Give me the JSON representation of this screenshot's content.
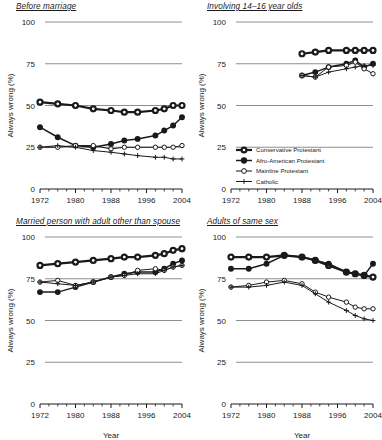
{
  "figure": {
    "axis_label_y": "Always wrong (%)",
    "axis_label_x": "Year",
    "y_ticks": [
      0,
      25,
      50,
      75,
      100
    ],
    "x_ticks": [
      1972,
      1980,
      1988,
      1996,
      2004
    ],
    "x_minor_step": 2,
    "ylim": [
      0,
      100
    ],
    "xlim": [
      1972,
      2004
    ],
    "grid": "horizontal-only",
    "colors": {
      "line": "#1a1a1a",
      "grid": "#8e8e8e",
      "background": "#ffffff"
    }
  },
  "legend": {
    "position": "bottom-left of top-right panel",
    "entries": [
      {
        "label": "Conservative Protestant",
        "marker": "open-circle",
        "line_width": "thick",
        "key": "conservative_protestant"
      },
      {
        "label": "Afro-American Protestant",
        "marker": "filled-circle",
        "line_width": "medium",
        "key": "afro_american_protestant"
      },
      {
        "label": "Mainline Protestant",
        "marker": "open-circle",
        "line_width": "thin",
        "key": "mainline_protestant"
      },
      {
        "label": "Catholic",
        "marker": "plus",
        "line_width": "thin",
        "key": "catholic"
      }
    ]
  },
  "chart_data": [
    {
      "id": "before-marriage",
      "type": "line",
      "title": "Before marriage",
      "xlabel": "",
      "ylabel": "Always wrong (%)",
      "xlim": [
        1972,
        2004
      ],
      "ylim": [
        0,
        100
      ],
      "x": [
        1972,
        1976,
        1980,
        1984,
        1988,
        1991,
        1994,
        1998,
        2000,
        2002,
        2004
      ],
      "series": [
        {
          "name": "Conservative Protestant",
          "marker": "open-circle",
          "line_width": "thick",
          "values": [
            52,
            51,
            50,
            48,
            47,
            46,
            46,
            47,
            48,
            50,
            50
          ]
        },
        {
          "name": "Afro-American Protestant",
          "marker": "filled-circle",
          "line_width": "medium",
          "values": [
            37,
            31,
            26,
            25,
            27,
            29,
            30,
            32,
            35,
            38,
            43
          ]
        },
        {
          "name": "Mainline Protestant",
          "marker": "open-circle",
          "line_width": "thin",
          "values": [
            25,
            25,
            26,
            26,
            24,
            25,
            25,
            25,
            25,
            25,
            26
          ]
        },
        {
          "name": "Catholic",
          "marker": "plus",
          "line_width": "thin",
          "values": [
            25,
            26,
            25,
            23,
            22,
            21,
            20,
            19,
            19,
            18,
            18
          ]
        }
      ]
    },
    {
      "id": "involving-14-16-year-olds",
      "type": "line",
      "title": "Involving 14–16 year olds",
      "xlabel": "",
      "ylabel": "Always wrong (%)",
      "xlim": [
        1972,
        2004
      ],
      "ylim": [
        0,
        100
      ],
      "x": [
        1988,
        1991,
        1994,
        1998,
        2000,
        2002,
        2004
      ],
      "series": [
        {
          "name": "Conservative Protestant",
          "marker": "open-circle",
          "line_width": "thick",
          "values": [
            81,
            82,
            83,
            83,
            83,
            83,
            83
          ]
        },
        {
          "name": "Afro-American Protestant",
          "marker": "filled-circle",
          "line_width": "medium",
          "values": [
            68,
            70,
            73,
            75,
            77,
            73,
            75
          ]
        },
        {
          "name": "Mainline Protestant",
          "marker": "open-circle",
          "line_width": "thin",
          "values": [
            68,
            67,
            73,
            74,
            76,
            72,
            69
          ]
        },
        {
          "name": "Catholic",
          "marker": "plus",
          "line_width": "thin",
          "values": [
            68,
            67,
            70,
            72,
            73,
            74,
            74
          ]
        }
      ]
    },
    {
      "id": "married-person-with-adult-other-than-spouse",
      "type": "line",
      "title": "Married person with adult other than spouse",
      "xlabel": "Year",
      "ylabel": "Always wrong (%)",
      "xlim": [
        1972,
        2004
      ],
      "ylim": [
        0,
        100
      ],
      "x": [
        1972,
        1976,
        1980,
        1984,
        1988,
        1991,
        1994,
        1998,
        2000,
        2002,
        2004
      ],
      "series": [
        {
          "name": "Conservative Protestant",
          "marker": "open-circle",
          "line_width": "thick",
          "values": [
            83,
            84,
            85,
            86,
            87,
            88,
            88,
            89,
            90,
            92,
            93
          ]
        },
        {
          "name": "Afro-American Protestant",
          "marker": "filled-circle",
          "line_width": "medium",
          "values": [
            67,
            67,
            70,
            73,
            76,
            78,
            79,
            79,
            81,
            84,
            86
          ]
        },
        {
          "name": "Mainline Protestant",
          "marker": "open-circle",
          "line_width": "thin",
          "values": [
            73,
            74,
            71,
            73,
            76,
            77,
            80,
            81,
            80,
            82,
            83
          ]
        },
        {
          "name": "Catholic",
          "marker": "plus",
          "line_width": "thin",
          "values": [
            73,
            72,
            71,
            73,
            76,
            77,
            78,
            78,
            80,
            82,
            83
          ]
        }
      ]
    },
    {
      "id": "adults-of-same-sex",
      "type": "line",
      "title": "Adults of same sex",
      "xlabel": "Year",
      "ylabel": "Always wrong (%)",
      "xlim": [
        1972,
        2004
      ],
      "ylim": [
        0,
        100
      ],
      "x": [
        1972,
        1976,
        1980,
        1984,
        1988,
        1991,
        1994,
        1998,
        2000,
        2002,
        2004
      ],
      "series": [
        {
          "name": "Conservative Protestant",
          "marker": "open-circle",
          "line_width": "thick",
          "values": [
            88,
            88,
            88,
            89,
            88,
            86,
            83,
            79,
            78,
            77,
            76
          ]
        },
        {
          "name": "Afro-American Protestant",
          "marker": "filled-circle",
          "line_width": "medium",
          "values": [
            81,
            81,
            84,
            89,
            88,
            86,
            84,
            79,
            78,
            77,
            84
          ]
        },
        {
          "name": "Mainline Protestant",
          "marker": "open-circle",
          "line_width": "thin",
          "values": [
            70,
            71,
            73,
            74,
            72,
            67,
            64,
            61,
            58,
            57,
            57
          ]
        },
        {
          "name": "Catholic",
          "marker": "plus",
          "line_width": "thin",
          "values": [
            70,
            70,
            71,
            73,
            71,
            66,
            61,
            56,
            53,
            51,
            50
          ]
        }
      ]
    }
  ]
}
